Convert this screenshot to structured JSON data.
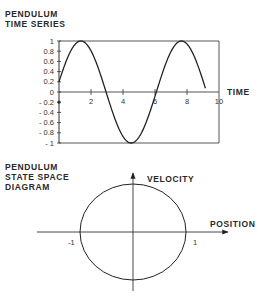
{
  "chart_data": [
    {
      "type": "line",
      "title": "PENDULUM TIME SERIES",
      "title_lines": [
        "PENDULUM",
        "TIME SERIES"
      ],
      "xlabel": "TIME",
      "ylabel": "",
      "xlim": [
        0,
        10
      ],
      "ylim": [
        -1,
        1
      ],
      "x_ticks": [
        0,
        2,
        4,
        6,
        8,
        10
      ],
      "x_tick_labels": [
        "",
        "2",
        "4",
        "6",
        "8",
        "10"
      ],
      "y_ticks": [
        1,
        0.8,
        0.6,
        0.4,
        0.2,
        0,
        -0.2,
        -0.4,
        -0.6,
        -0.8,
        -1
      ],
      "y_tick_labels": [
        "1",
        "0.8",
        "0.6",
        "0.4",
        "0.2",
        "0",
        "- 0.2",
        "- 0.4",
        "- 0.6",
        "- 0.8",
        "- 1"
      ],
      "grid": false,
      "series": [
        {
          "name": "position",
          "function": "sin(t + 0.2)",
          "x": [
            0,
            0.5,
            1,
            1.37,
            2,
            2.5,
            2.94,
            3.5,
            4,
            4.51,
            5,
            5.5,
            6.08,
            6.5,
            7,
            7.65,
            8,
            8.5,
            9,
            9.22
          ],
          "values": [
            0.2,
            0.64,
            0.93,
            1.0,
            0.81,
            0.45,
            0.0,
            -0.48,
            -0.87,
            -1.0,
            -0.89,
            -0.58,
            0.0,
            0.41,
            0.81,
            1.0,
            0.94,
            0.62,
            0.11,
            -0.1
          ]
        }
      ]
    },
    {
      "type": "line",
      "title": "PENDULUM STATE SPACE DIAGRAM",
      "title_lines": [
        "PENDULUM",
        "STATE SPACE",
        "DIAGRAM"
      ],
      "xlabel": "POSITION",
      "ylabel": "VELOCITY",
      "xlim": [
        -1.8,
        1.8
      ],
      "ylim": [
        -1.2,
        1.2
      ],
      "x_tick_labels": [
        "-1",
        "1"
      ],
      "x_ticks": [
        -1,
        1
      ],
      "grid": false,
      "series": [
        {
          "name": "orbit",
          "shape": "circle",
          "center": [
            0,
            0
          ],
          "radius": 1
        }
      ]
    }
  ]
}
